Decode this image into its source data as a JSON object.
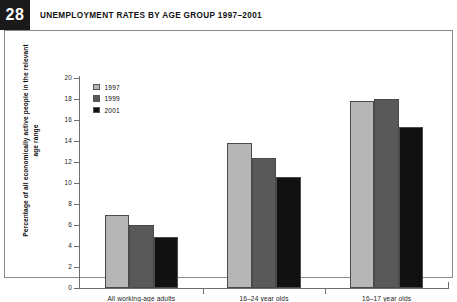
{
  "figure": {
    "number": "28",
    "title": "UNEMPLOYMENT RATES BY AGE GROUP 1997–2001"
  },
  "chart_data": {
    "type": "bar",
    "title": "UNEMPLOYMENT RATES BY AGE GROUP 1997–2001",
    "xlabel": "",
    "ylabel": "Percentage of all economically active people in the relevant age range",
    "categories": [
      "All working-age adults",
      "16–24 year olds",
      "16–17 year olds"
    ],
    "series": [
      {
        "name": "1997",
        "color": "#b6b6b6",
        "values": [
          7.0,
          13.8,
          17.8
        ]
      },
      {
        "name": "1999",
        "color": "#595959",
        "values": [
          6.0,
          12.4,
          18.0
        ]
      },
      {
        "name": "2001",
        "color": "#111111",
        "values": [
          4.9,
          10.6,
          15.3
        ]
      }
    ],
    "ylim": [
      0,
      20
    ],
    "yticks": [
      0,
      2,
      4,
      6,
      8,
      10,
      12,
      14,
      16,
      18,
      20
    ],
    "ytick_labels": [
      "0",
      "2",
      "4",
      "6",
      "8",
      "10",
      "12",
      "14",
      "16",
      "18",
      "20"
    ],
    "grid": false,
    "legend_position": "upper-left"
  }
}
